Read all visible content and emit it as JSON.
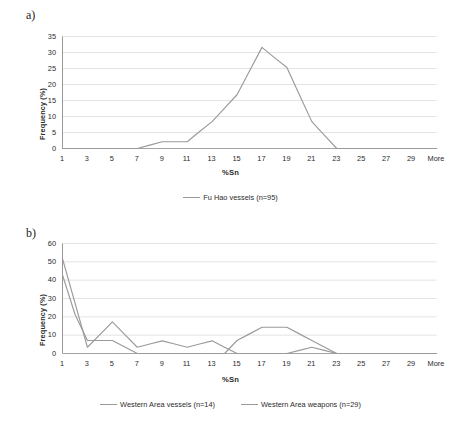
{
  "figure": {
    "panel_a_letter": "a)",
    "panel_b_letter": "b)"
  },
  "chart_data": [
    {
      "id": "a",
      "type": "line",
      "title": "",
      "xlabel": "%Sn",
      "ylabel": "Frequency (%)",
      "xlim": [
        1,
        31
      ],
      "ylim": [
        0,
        35
      ],
      "ytick_values": [
        0,
        5,
        10,
        15,
        20,
        25,
        30,
        35
      ],
      "ytick_labels": [
        "0",
        "5",
        "10",
        "15",
        "20",
        "25",
        "30",
        "35"
      ],
      "xtick_labels": [
        "1",
        "3",
        "5",
        "7",
        "9",
        "11",
        "13",
        "15",
        "17",
        "19",
        "21",
        "23",
        "25",
        "27",
        "29",
        "More"
      ],
      "grid": "horizontal",
      "legend_position": "bottom",
      "line_color": "#9a9a9a",
      "x": [
        1,
        2,
        3,
        4,
        5,
        6,
        7,
        8,
        9,
        10,
        11,
        12,
        13,
        14,
        15,
        16,
        17,
        18,
        19,
        20,
        21,
        22,
        23,
        24,
        25,
        26,
        27,
        28,
        29,
        30,
        31
      ],
      "series": [
        {
          "name": "Fu Hao vessels (n=95)",
          "color": "#9a9a9a",
          "values": [
            0,
            0,
            0,
            0,
            0,
            0,
            0,
            1.05,
            2.1,
            2.1,
            2.1,
            5.3,
            8.4,
            12.6,
            16.8,
            24.2,
            31.6,
            28.4,
            25.3,
            16.8,
            8.4,
            4.2,
            0,
            0,
            0,
            0,
            0,
            0,
            0,
            0,
            0
          ]
        }
      ]
    },
    {
      "id": "b",
      "type": "line",
      "title": "",
      "xlabel": "%Sn",
      "ylabel": "Frequency (%)",
      "xlim": [
        1,
        31
      ],
      "ylim": [
        0,
        60
      ],
      "ytick_values": [
        0,
        10,
        20,
        30,
        40,
        50,
        60
      ],
      "ytick_labels": [
        "0",
        "10",
        "20",
        "30",
        "40",
        "50",
        "60"
      ],
      "xtick_labels": [
        "1",
        "3",
        "5",
        "7",
        "9",
        "11",
        "13",
        "15",
        "17",
        "19",
        "21",
        "23",
        "25",
        "27",
        "29",
        "More"
      ],
      "grid": "horizontal",
      "legend_position": "bottom",
      "x": [
        1,
        2,
        3,
        4,
        5,
        6,
        7,
        8,
        9,
        10,
        11,
        12,
        13,
        14,
        15,
        16,
        17,
        18,
        19,
        20,
        21,
        22,
        23,
        24,
        25,
        26,
        27,
        28,
        29,
        30,
        31
      ],
      "series": [
        {
          "name": "Western Area vessels (n=14)",
          "color": "#9a9a9a",
          "values": [
            42.9,
            21.4,
            7.1,
            7.1,
            7.1,
            3.6,
            0,
            0,
            0,
            0,
            0,
            0,
            0,
            0,
            7.1,
            10.7,
            14.3,
            14.3,
            14.3,
            10.7,
            7.1,
            3.6,
            0,
            0,
            0,
            0,
            0,
            0,
            0,
            0,
            0
          ]
        },
        {
          "name": "Western Area weapons (n=29)",
          "color": "#9a9a9a",
          "values": [
            51.7,
            27.6,
            3.4,
            10.3,
            17.2,
            10.3,
            3.4,
            5.2,
            6.9,
            5.2,
            3.4,
            5.2,
            6.9,
            3.4,
            0,
            0,
            0,
            0,
            0,
            1.7,
            3.4,
            1.7,
            0,
            0,
            0,
            0,
            0,
            0,
            0,
            0,
            0
          ]
        }
      ]
    }
  ]
}
